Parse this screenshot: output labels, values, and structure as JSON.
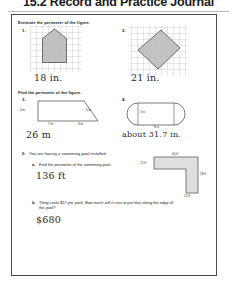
{
  "header": {
    "title": "15.2 Record and Practice Journal"
  },
  "sections": [
    {
      "id": "s1",
      "instruction": "Estimate the perimeter of the figure."
    },
    {
      "id": "s2",
      "instruction": "Find the perimeter of the figure."
    }
  ],
  "problems": {
    "p1": {
      "number": "1.",
      "answer": "18 in.",
      "shape": "pentagon-house-on-grid"
    },
    "p2": {
      "number": "2.",
      "answer": "21 in.",
      "shape": "rotated-square-on-grid"
    },
    "p3": {
      "number": "3.",
      "answer": "26 m",
      "shape": "trapezoid",
      "labels": {
        "left": "4 m",
        "slant": "5 m",
        "bottom_left": "7 m",
        "bottom_right": "3 m"
      }
    },
    "p4": {
      "number": "4.",
      "answer": "about 31.7 in.",
      "shape": "stadium-capsule",
      "labels": {
        "height": "5 in.",
        "width": "8 in."
      }
    },
    "p5": {
      "number": "5.",
      "prompt": "You are having a swimming pool installed.",
      "part_a": {
        "label": "a.",
        "prompt": "Find the perimeter of the swimming pool.",
        "answer": "136 ft"
      },
      "part_b": {
        "label": "b.",
        "prompt": "Tiling costs $17 per yard. How much will it cost to put tiles along the edge of the pool?",
        "answer": "$680"
      },
      "diagram": {
        "shape": "L-shaped-pool",
        "labels": {
          "top": "40 ft",
          "left": "12 ft",
          "right": "28 ft",
          "bottom": "12 ft"
        }
      }
    }
  },
  "colors": {
    "figure_fill": "#b8b8b8",
    "figure_stroke": "#5e5e5e",
    "grid_line": "#c9c9c9",
    "border": "#4a4a4a",
    "ink": "#2a2a2a"
  }
}
